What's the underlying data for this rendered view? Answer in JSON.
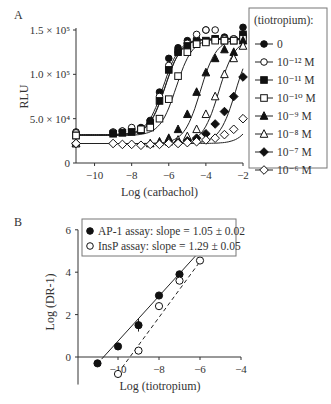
{
  "chart_data": [
    {
      "panel_label": "A",
      "type": "line",
      "xlabel": "Log (carbachol)",
      "ylabel": "RLU",
      "xlim": [
        -11,
        -2
      ],
      "ylim": [
        0,
        150000
      ],
      "xticks": [
        "-10",
        "-8",
        "-6",
        "-4",
        "-2"
      ],
      "yticks": [
        {
          "value": 0,
          "label": "0"
        },
        {
          "value": 50000,
          "label": "5.0 × 10⁴"
        },
        {
          "value": 100000,
          "label": "1.0 × 10⁵"
        },
        {
          "value": 150000,
          "label": "1.5 × 10⁵"
        }
      ],
      "legend_title": "(tiotropium):",
      "legend_position": "right",
      "series": [
        {
          "name": "0",
          "marker": "filled-circle",
          "bottom": 32000,
          "top": 140000,
          "ec50": -6.3,
          "x": [
            -11,
            -9,
            -8.5,
            -8,
            -7.5,
            -7,
            -6.5,
            -6,
            -5.5,
            -5,
            -4.5,
            -4,
            -3.5,
            -3,
            -2.5,
            -2
          ],
          "y": [
            35000,
            35000,
            36000,
            38000,
            40000,
            48000,
            80000,
            118000,
            130000,
            138000,
            140000,
            150000,
            140000,
            142000,
            140000,
            153000
          ]
        },
        {
          "name": "10⁻¹² M",
          "marker": "open-circle",
          "bottom": 32000,
          "top": 140000,
          "ec50": -6.2,
          "x": [
            -11,
            -9,
            -8.5,
            -8,
            -7.5,
            -7,
            -6.5,
            -6,
            -5.5,
            -5,
            -4.5,
            -4,
            -3.5,
            -3,
            -2.5,
            -2
          ],
          "y": [
            34000,
            34000,
            36000,
            40000,
            38000,
            45000,
            75000,
            110000,
            125000,
            135000,
            145000,
            150000,
            150000,
            140000,
            140000,
            145000
          ]
        },
        {
          "name": "10⁻¹¹ M",
          "marker": "filled-square",
          "bottom": 31000,
          "top": 140000,
          "ec50": -6.2,
          "x": [
            -11,
            -9,
            -8.5,
            -8,
            -7.5,
            -7,
            -6.5,
            -6,
            -5.5,
            -5,
            -4.5,
            -4,
            -3.5,
            -3,
            -2.5,
            -2
          ],
          "y": [
            31000,
            33000,
            34000,
            35000,
            37000,
            45000,
            70000,
            105000,
            125000,
            132000,
            136000,
            138000,
            140000,
            138000,
            138000,
            145000
          ]
        },
        {
          "name": "10⁻¹⁰ M",
          "marker": "open-square",
          "bottom": 31000,
          "top": 140000,
          "ec50": -5.6,
          "x": [
            -11,
            -7.5,
            -7,
            -6.5,
            -6,
            -5.5,
            -5,
            -4.5,
            -4,
            -3.5,
            -3,
            -2.5,
            -2
          ],
          "y": [
            31000,
            38000,
            40000,
            50000,
            72000,
            98000,
            125000,
            134000,
            136000,
            138000,
            138000,
            138000,
            140000
          ]
        },
        {
          "name": "10⁻⁹ M",
          "marker": "filled-triangle",
          "bottom": 22000,
          "top": 140000,
          "ec50": -4.3,
          "x": [
            -11,
            -7,
            -6.5,
            -6,
            -5.5,
            -5,
            -4.5,
            -4,
            -3.5,
            -3,
            -2.5,
            -2
          ],
          "y": [
            22000,
            22000,
            24000,
            28000,
            38000,
            55000,
            80000,
            102000,
            118000,
            128000,
            125000,
            138000
          ]
        },
        {
          "name": "10⁻⁸ M",
          "marker": "open-triangle",
          "bottom": 22000,
          "top": 140000,
          "ec50": -3.3,
          "x": [
            -11,
            -6,
            -5.5,
            -5,
            -4.5,
            -4,
            -3.5,
            -3,
            -2.5,
            -2
          ],
          "y": [
            22000,
            24000,
            26000,
            30000,
            38000,
            55000,
            75000,
            100000,
            118000,
            132000
          ]
        },
        {
          "name": "10⁻⁷ M",
          "marker": "filled-diamond",
          "bottom": 22000,
          "top": 140000,
          "ec50": -2.4,
          "x": [
            -11,
            -5.5,
            -5,
            -4.5,
            -4,
            -3.5,
            -3,
            -2.5,
            -2
          ],
          "y": [
            22000,
            23000,
            25000,
            28000,
            33000,
            44000,
            58000,
            75000,
            97000
          ]
        },
        {
          "name": "10⁻⁶ M",
          "marker": "open-diamond",
          "bottom": 22000,
          "top": 140000,
          "ec50": -1.0,
          "x": [
            -11,
            -9,
            -8.5,
            -8,
            -7.5,
            -7,
            -6.5,
            -6,
            -5.5,
            -5,
            -4.5,
            -4,
            -3.5,
            -3,
            -2.5,
            -2
          ],
          "y": [
            22000,
            22000,
            21000,
            21000,
            20000,
            21000,
            21000,
            22000,
            22000,
            23000,
            24000,
            26000,
            28000,
            32000,
            38000,
            50000
          ]
        }
      ]
    },
    {
      "panel_label": "B",
      "type": "scatter",
      "xlabel": "Log (tiotropium)",
      "ylabel": "Log (DR-1)",
      "xlim": [
        -11,
        -4
      ],
      "ylim": [
        -1,
        6
      ],
      "xticks": [
        "-10",
        "-8",
        "-6",
        "-4"
      ],
      "yticks": [
        "0",
        "2",
        "4",
        "6"
      ],
      "legend_position": "top",
      "series": [
        {
          "name": "AP-1 assay: slope = 1.05 ± 0.02",
          "marker": "filled-circle",
          "line": "solid",
          "x": [
            -11,
            -10,
            -9,
            -8,
            -7,
            -6
          ],
          "y": [
            -0.3,
            0.5,
            1.5,
            2.9,
            3.9,
            5.0
          ],
          "fit": {
            "x": [
              -10.8,
              -6
            ],
            "y": [
              -0.1,
              5.0
            ]
          }
        },
        {
          "name": "InsP assay: slope = 1.29 ± 0.05",
          "marker": "open-circle",
          "line": "dashed",
          "x": [
            -10,
            -9,
            -8,
            -7,
            -6
          ],
          "y": [
            -0.8,
            0.3,
            2.4,
            3.6,
            4.55
          ],
          "fit": {
            "x": [
              -9.8,
              -6
            ],
            "y": [
              -0.5,
              4.5
            ]
          }
        }
      ]
    }
  ]
}
